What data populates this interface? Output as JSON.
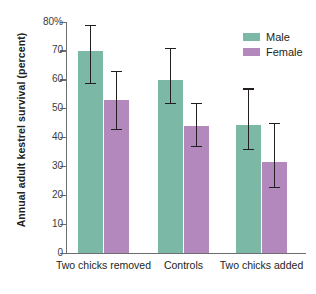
{
  "chart_data": {
    "type": "bar",
    "title": "",
    "xlabel": "",
    "ylabel": "Annual adult kestrel survival (percent)",
    "categories": [
      "Two chicks removed",
      "Controls",
      "Two chicks added"
    ],
    "ylim": [
      0,
      80
    ],
    "yticks": [
      0,
      10,
      20,
      30,
      40,
      50,
      60,
      70,
      80
    ],
    "ytick_labels": [
      "0",
      "10",
      "20",
      "30",
      "40",
      "50",
      "60",
      "70",
      "80%"
    ],
    "grid": false,
    "legend_position": "top-right",
    "series": [
      {
        "name": "Male",
        "color": "#7cb8a6",
        "values": [
          70,
          60,
          44.5
        ],
        "error_low": [
          59,
          52,
          36
        ],
        "error_high": [
          79,
          71,
          57
        ]
      },
      {
        "name": "Female",
        "color": "#b288bd",
        "values": [
          53,
          44,
          31.5
        ],
        "error_low": [
          43,
          37,
          23
        ],
        "error_high": [
          63,
          52,
          45
        ]
      }
    ]
  },
  "axis": {
    "y_title": "Annual adult kestrel survival (percent)"
  },
  "legend": {
    "items": [
      {
        "label": "Male",
        "color": "#7cb8a6"
      },
      {
        "label": "Female",
        "color": "#b288bd"
      }
    ]
  }
}
